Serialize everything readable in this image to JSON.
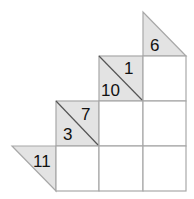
{
  "puzzle": {
    "type": "kakuro",
    "colors": {
      "clue_fill": "#e3e3e3",
      "grid_line": "#a8a8a8",
      "cell_fill": "#ffffff",
      "text": "#111111"
    },
    "clues": [
      {
        "id": "clue-6",
        "down": "6",
        "across": null
      },
      {
        "id": "clue-10-1",
        "down": "10",
        "across": "1"
      },
      {
        "id": "clue-3-7",
        "down": "3",
        "across": "7"
      },
      {
        "id": "clue-11",
        "down": null,
        "across": "11"
      }
    ],
    "cells": [
      {
        "row": 1,
        "col": 3,
        "value": ""
      },
      {
        "row": 2,
        "col": 2,
        "value": ""
      },
      {
        "row": 2,
        "col": 3,
        "value": ""
      },
      {
        "row": 3,
        "col": 1,
        "value": ""
      },
      {
        "row": 3,
        "col": 2,
        "value": ""
      },
      {
        "row": 3,
        "col": 3,
        "value": ""
      }
    ]
  }
}
